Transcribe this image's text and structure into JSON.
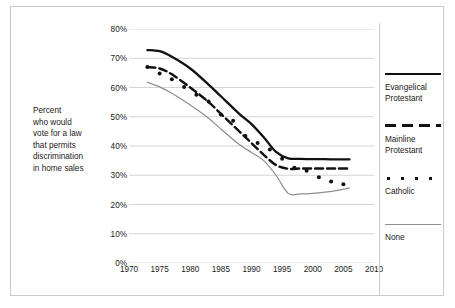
{
  "axis_caption": [
    "Percent",
    "who would",
    "vote for a law",
    "that permits",
    "discrimination",
    "in home sales"
  ],
  "legend": {
    "items": [
      {
        "label_lines": [
          "Evangelical",
          "Protestant"
        ],
        "style": "solid",
        "color": "#111111"
      },
      {
        "label_lines": [
          "Mainline",
          "Protestant"
        ],
        "style": "dashed",
        "color": "#111111"
      },
      {
        "label_lines": [
          "Catholic"
        ],
        "style": "dotted",
        "color": "#111111"
      },
      {
        "label_lines": [
          "None"
        ],
        "style": "thin",
        "color": "#8e8e8e"
      }
    ]
  },
  "chart_data": {
    "type": "line",
    "title": "",
    "xlabel": "",
    "ylabel": "Percent who would vote for a law that permits discrimination in home sales",
    "xlim": [
      1970,
      2010
    ],
    "ylim": [
      0,
      80
    ],
    "xticks": [
      1970,
      1975,
      1980,
      1985,
      1990,
      1995,
      2000,
      2005,
      2010
    ],
    "xtick_labels": [
      "1970",
      "1975",
      "1980",
      "1985",
      "1990",
      "1995",
      "2000",
      "2005",
      "2010"
    ],
    "yticks": [
      0,
      10,
      20,
      30,
      40,
      50,
      60,
      70,
      80
    ],
    "ytick_labels": [
      "0%",
      "10%",
      "20%",
      "30%",
      "40%",
      "50%",
      "60%",
      "70%",
      "80%"
    ],
    "grid": "horizontal",
    "legend_position": "right",
    "series": [
      {
        "name": "Evangelical Protestant",
        "style": "solid",
        "color": "#111111",
        "x": [
          1973,
          1975,
          1977,
          1980,
          1983,
          1985,
          1988,
          1990,
          1992,
          1994,
          1996,
          1998,
          2000,
          2002,
          2004,
          2006
        ],
        "values": [
          72.8,
          72.4,
          70.5,
          66.5,
          61.0,
          57.0,
          51.0,
          47.5,
          43.0,
          38.0,
          35.8,
          35.6,
          35.5,
          35.5,
          35.4,
          35.4
        ]
      },
      {
        "name": "Mainline Protestant",
        "style": "dashed",
        "color": "#111111",
        "x": [
          1973,
          1975,
          1977,
          1980,
          1983,
          1985,
          1988,
          1990,
          1992,
          1994,
          1996,
          1998,
          2000,
          2002,
          2004,
          2006
        ],
        "values": [
          67.0,
          66.5,
          64.5,
          60.0,
          55.0,
          51.0,
          45.0,
          41.0,
          37.0,
          33.5,
          32.2,
          32.3,
          32.3,
          32.3,
          32.3,
          32.3
        ]
      },
      {
        "name": "Catholic",
        "style": "dotted",
        "color": "#111111",
        "x": [
          1973,
          1975,
          1977,
          1979,
          1981,
          1983,
          1985,
          1987,
          1989,
          1991,
          1993,
          1995,
          1997,
          1999,
          2001,
          2003,
          2005
        ],
        "values": [
          67.0,
          64.8,
          62.8,
          60.2,
          57.5,
          55.2,
          50.8,
          48.6,
          43.4,
          41.0,
          38.8,
          35.6,
          32.6,
          31.5,
          29.3,
          27.9,
          26.9
        ]
      },
      {
        "name": "None",
        "style": "thin",
        "color": "#8e8e8e",
        "x": [
          1973,
          1975,
          1977,
          1980,
          1983,
          1985,
          1988,
          1990,
          1992,
          1994,
          1996,
          1998,
          2000,
          2002,
          2004,
          2006
        ],
        "values": [
          61.8,
          60.2,
          58.0,
          54.0,
          49.5,
          45.8,
          40.5,
          37.8,
          35.0,
          30.0,
          23.8,
          23.6,
          23.8,
          24.2,
          24.8,
          25.7
        ]
      }
    ]
  }
}
